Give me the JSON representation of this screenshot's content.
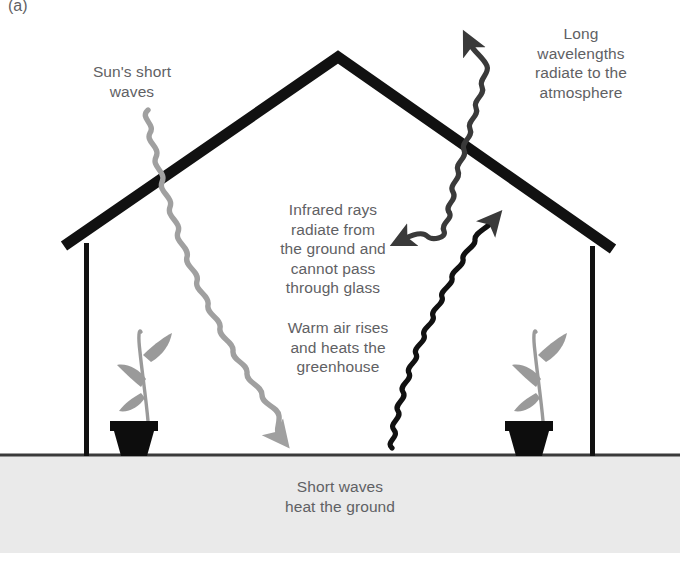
{
  "figure": {
    "panel_letter": "(a)"
  },
  "labels": {
    "sun_short_waves": "Sun's short\nwaves",
    "long_wavelengths": "Long\nwavelengths\nradiate to the\natmosphere",
    "infrared_rays": "Infrared rays\nradiate from\nthe ground and\ncannot pass\nthrough glass",
    "warm_air": "Warm air rises\nand heats the\ngreenhouse",
    "short_waves_ground": "Short waves\nheat the ground"
  },
  "colors": {
    "background": "#ffffff",
    "structure": "#111111",
    "text": "#5f6164",
    "short_wave": "#a0a0a0",
    "long_wave": "#3a3a3a",
    "ground_fill": "#eaeaea",
    "ground_line": "#3a3a3a",
    "plant_foliage": "#9a9a9a",
    "plant_pot": "#0d0d0d"
  },
  "elements": {
    "roof_label": "greenhouse-roof",
    "left_wall_label": "greenhouse-left-wall",
    "right_wall_label": "greenhouse-right-wall",
    "ground_label": "ground-band",
    "left_plant_label": "potted-plant-left",
    "right_plant_label": "potted-plant-right",
    "sun_wave_label": "incoming-short-wave-arrow",
    "long_wave_label": "outgoing-long-wave-arrow",
    "infrared_wave_label": "infrared-reflected-arrow",
    "warm_air_wave_label": "warm-air-rising-arrow"
  }
}
